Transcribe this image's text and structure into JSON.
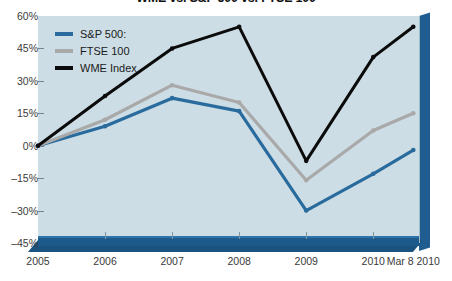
{
  "chart_data": {
    "type": "line",
    "title": "WME vs. S&P 500 vs. FTSE 100",
    "xlabel": "",
    "ylabel": "",
    "categories": [
      "2005",
      "2006",
      "2007",
      "2008",
      "2009",
      "2010",
      "Mar 8 2010"
    ],
    "x_tick_labels": [
      "2005",
      "2006",
      "2007",
      "2008",
      "2009",
      "2010",
      "Mar 8 2010"
    ],
    "y_tick_labels": [
      "60%",
      "45%",
      "30%",
      "15%",
      "0%",
      "–15%",
      "–30%",
      "–45%"
    ],
    "y_tick_values": [
      60,
      45,
      30,
      15,
      0,
      -15,
      -30,
      -45
    ],
    "ylim": [
      -45,
      60
    ],
    "grid": false,
    "legend_position": "top-left",
    "series": [
      {
        "name": "S&P 500:",
        "color": "#2a6b9e",
        "values": [
          0,
          9,
          22,
          16,
          -30,
          -13,
          -2
        ]
      },
      {
        "name": "FTSE 100",
        "color": "#a9a9a9",
        "values": [
          0,
          12,
          28,
          20,
          -16,
          7,
          15
        ]
      },
      {
        "name": "WME Index",
        "color": "#0b0b0b",
        "values": [
          0,
          23,
          45,
          55,
          -7,
          41,
          55
        ]
      }
    ]
  },
  "legend": {
    "entries": [
      {
        "label": "S&P 500:",
        "color": "#2a6b9e"
      },
      {
        "label": "FTSE 100",
        "color": "#a9a9a9"
      },
      {
        "label": "WME Index",
        "color": "#0b0b0b"
      }
    ]
  },
  "colors": {
    "plot_background": "#ccdde5",
    "base_bar": "#1c5a8c",
    "side_panel": "#1f5d91",
    "axis_text": "#3a3a3a"
  }
}
